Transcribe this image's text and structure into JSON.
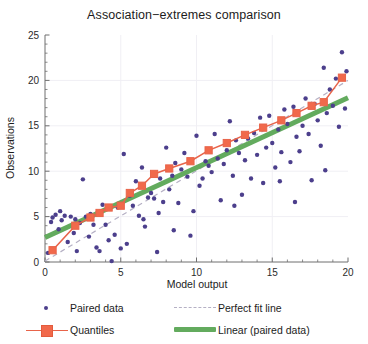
{
  "chart_data": {
    "type": "scatter",
    "title": "Association−extremes comparison",
    "xlabel": "Model output",
    "ylabel": "Observations",
    "xlim": [
      0,
      20
    ],
    "ylim": [
      0,
      25
    ],
    "xticks": [
      0,
      5,
      10,
      15,
      20
    ],
    "yticks": [
      0,
      5,
      10,
      15,
      20,
      25
    ],
    "grid": true,
    "legend_position": "below-plot",
    "series": [
      {
        "name": "Paired data",
        "type": "scatter",
        "color": "#4c3f8c",
        "marker": "circle",
        "points": [
          [
            0.2,
            1.0
          ],
          [
            0.4,
            4.4
          ],
          [
            0.5,
            4.9
          ],
          [
            0.7,
            5.2
          ],
          [
            0.9,
            3.6
          ],
          [
            1.1,
            4.6
          ],
          [
            1.3,
            5.1
          ],
          [
            1.5,
            2.2
          ],
          [
            1.7,
            5.0
          ],
          [
            1.9,
            3.2
          ],
          [
            2.1,
            1.2
          ],
          [
            2.3,
            4.3
          ],
          [
            2.5,
            9.1
          ],
          [
            2.7,
            5.0
          ],
          [
            2.9,
            2.8
          ],
          [
            3.2,
            4.1
          ],
          [
            3.4,
            1.6
          ],
          [
            3.6,
            1.2
          ],
          [
            3.8,
            6.3
          ],
          [
            4.0,
            4.1
          ],
          [
            4.2,
            2.4
          ],
          [
            4.4,
            0.1
          ],
          [
            4.6,
            3.0
          ],
          [
            4.8,
            6.0
          ],
          [
            5.0,
            1.5
          ],
          [
            5.2,
            11.9
          ],
          [
            5.4,
            2.0
          ],
          [
            5.6,
            7.3
          ],
          [
            5.8,
            6.2
          ],
          [
            6.0,
            8.9
          ],
          [
            6.2,
            5.1
          ],
          [
            6.4,
            10.4
          ],
          [
            6.6,
            3.9
          ],
          [
            6.8,
            7.1
          ],
          [
            7.0,
            7.6
          ],
          [
            7.2,
            7.0
          ],
          [
            7.4,
            1.1
          ],
          [
            7.6,
            9.2
          ],
          [
            7.8,
            6.6
          ],
          [
            8.0,
            12.6
          ],
          [
            8.2,
            8.0
          ],
          [
            8.4,
            9.5
          ],
          [
            8.6,
            10.9
          ],
          [
            8.8,
            6.5
          ],
          [
            9.0,
            10.2
          ],
          [
            9.2,
            12.0
          ],
          [
            9.4,
            9.4
          ],
          [
            9.6,
            2.9
          ],
          [
            9.8,
            5.6
          ],
          [
            10.0,
            13.9
          ],
          [
            10.2,
            8.4
          ],
          [
            10.4,
            9.2
          ],
          [
            10.6,
            11.1
          ],
          [
            10.8,
            10.6
          ],
          [
            11.0,
            9.9
          ],
          [
            11.2,
            14.1
          ],
          [
            11.4,
            11.4
          ],
          [
            11.6,
            6.8
          ],
          [
            11.8,
            10.8
          ],
          [
            12.0,
            12.3
          ],
          [
            12.2,
            15.5
          ],
          [
            12.4,
            9.5
          ],
          [
            12.6,
            13.4
          ],
          [
            12.8,
            12.0
          ],
          [
            13.0,
            7.4
          ],
          [
            13.2,
            11.2
          ],
          [
            13.4,
            13.6
          ],
          [
            13.6,
            9.2
          ],
          [
            13.8,
            14.2
          ],
          [
            14.0,
            11.8
          ],
          [
            14.2,
            15.9
          ],
          [
            14.4,
            8.7
          ],
          [
            14.6,
            12.6
          ],
          [
            14.8,
            16.1
          ],
          [
            15.0,
            13.1
          ],
          [
            15.2,
            10.4
          ],
          [
            15.4,
            14.6
          ],
          [
            15.6,
            12.1
          ],
          [
            15.8,
            16.8
          ],
          [
            16.0,
            15.2
          ],
          [
            16.2,
            11.0
          ],
          [
            16.4,
            17.1
          ],
          [
            16.6,
            13.8
          ],
          [
            16.8,
            12.2
          ],
          [
            17.0,
            15.0
          ],
          [
            17.2,
            18.0
          ],
          [
            17.4,
            14.1
          ],
          [
            17.6,
            9.0
          ],
          [
            17.8,
            17.4
          ],
          [
            18.0,
            15.6
          ],
          [
            18.2,
            12.8
          ],
          [
            18.4,
            21.4
          ],
          [
            18.6,
            16.4
          ],
          [
            18.8,
            19.0
          ],
          [
            19.0,
            17.2
          ],
          [
            19.2,
            20.2
          ],
          [
            19.4,
            14.9
          ],
          [
            19.6,
            23.1
          ],
          [
            19.8,
            16.9
          ],
          [
            19.9,
            21.0
          ],
          [
            1.0,
            5.6
          ],
          [
            2.0,
            4.7
          ],
          [
            3.0,
            5.3
          ],
          [
            6.5,
            4.7
          ],
          [
            7.5,
            5.4
          ],
          [
            8.5,
            3.5
          ],
          [
            12.5,
            6.2
          ],
          [
            15.5,
            8.9
          ],
          [
            16.5,
            6.6
          ],
          [
            18.5,
            10.1
          ]
        ]
      },
      {
        "name": "Perfect fit line",
        "type": "line",
        "style": "dashed",
        "color": "#b5b0c4",
        "points": [
          [
            0,
            0.1
          ],
          [
            20,
            20.0
          ]
        ]
      },
      {
        "name": "Quantiles",
        "type": "line-markers",
        "color": "#e8644a",
        "marker": "square",
        "marker_color": "#f1694b",
        "points": [
          [
            0.5,
            1.3
          ],
          [
            2.0,
            4.0
          ],
          [
            3.0,
            4.9
          ],
          [
            3.6,
            5.4
          ],
          [
            4.2,
            6.0
          ],
          [
            5.0,
            6.2
          ],
          [
            5.6,
            7.6
          ],
          [
            6.4,
            8.4
          ],
          [
            7.2,
            9.7
          ],
          [
            8.2,
            10.3
          ],
          [
            9.6,
            11.1
          ],
          [
            10.8,
            12.3
          ],
          [
            12.0,
            13.1
          ],
          [
            13.2,
            14.0
          ],
          [
            14.4,
            14.8
          ],
          [
            15.6,
            15.6
          ],
          [
            16.6,
            16.4
          ],
          [
            17.6,
            17.2
          ],
          [
            18.4,
            17.6
          ],
          [
            19.6,
            20.3
          ]
        ]
      },
      {
        "name": "Linear (paired data)",
        "type": "line",
        "style": "solid-thick",
        "color": "#63ab5e",
        "points": [
          [
            0,
            2.7
          ],
          [
            20,
            18.1
          ]
        ]
      }
    ]
  },
  "legend": {
    "items": [
      {
        "label": "Paired data",
        "key": "dot-marker-icon"
      },
      {
        "label": "Perfect fit line",
        "key": "dashed-line-icon"
      },
      {
        "label": "Quantiles",
        "key": "square-marker-line-icon"
      },
      {
        "label": "Linear (paired data)",
        "key": "thick-line-icon"
      }
    ]
  },
  "colors": {
    "paired_data": "#4c3f8c",
    "perfect_fit": "#b5b0c4",
    "quantiles": "#e8644a",
    "quantiles_marker": "#f1694b",
    "linear_fit": "#63ab5e",
    "axis": "#6f6f6f",
    "grid": "#f0eff4",
    "background": "#ffffff"
  }
}
